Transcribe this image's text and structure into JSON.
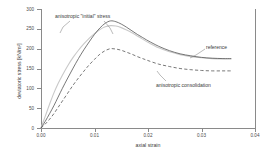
{
  "chart_data": {
    "type": "line",
    "title": "",
    "xlabel": "axial strain",
    "ylabel": "deviatoric stress [kN/m²]",
    "xlim": [
      0.0,
      0.04
    ],
    "ylim": [
      0,
      300
    ],
    "xticks": [
      "0.00",
      "0.01",
      "0.02",
      "0.03",
      "0.04"
    ],
    "xtick_values": [
      0.0,
      0.01,
      0.02,
      0.03,
      0.04
    ],
    "yticks": [
      "0",
      "50",
      "100",
      "150",
      "200",
      "250",
      "300"
    ],
    "ytick_values": [
      0,
      50,
      100,
      150,
      200,
      250,
      300
    ],
    "grid": false,
    "legend_position": "inline-annotations",
    "series": [
      {
        "name": "anisotropic \"initial\" stress",
        "style": "solid",
        "color": "#c9c9c9",
        "x": [
          0.0,
          0.0008,
          0.0016,
          0.0024,
          0.0032,
          0.004,
          0.005,
          0.006,
          0.007,
          0.008,
          0.009,
          0.01,
          0.011,
          0.012,
          0.013,
          0.014,
          0.015,
          0.016,
          0.017,
          0.018,
          0.019,
          0.02,
          0.022,
          0.024,
          0.026,
          0.028,
          0.03,
          0.032,
          0.034,
          0.0355
        ],
        "y": [
          0,
          30,
          60,
          88,
          112,
          133,
          157,
          178,
          196,
          212,
          226,
          238,
          248,
          255,
          258,
          257,
          253,
          247,
          240,
          232,
          224,
          216,
          202,
          192,
          185,
          180,
          177,
          175,
          174,
          174
        ]
      },
      {
        "name": "reference",
        "style": "solid",
        "color": "#555555",
        "x": [
          0.0,
          0.0008,
          0.0016,
          0.0024,
          0.0032,
          0.004,
          0.005,
          0.006,
          0.007,
          0.008,
          0.009,
          0.01,
          0.011,
          0.012,
          0.013,
          0.014,
          0.015,
          0.016,
          0.017,
          0.018,
          0.019,
          0.02,
          0.022,
          0.024,
          0.026,
          0.028,
          0.03,
          0.032,
          0.034,
          0.0355
        ],
        "y": [
          0,
          17,
          36,
          56,
          78,
          100,
          126,
          151,
          175,
          197,
          217,
          236,
          252,
          264,
          270,
          268,
          262,
          254,
          245,
          236,
          228,
          220,
          206,
          195,
          187,
          182,
          178,
          176,
          175,
          175
        ]
      },
      {
        "name": "anisotropic consolidation",
        "style": "dashed",
        "color": "#555555",
        "x": [
          0.0,
          0.0008,
          0.0016,
          0.0024,
          0.0032,
          0.004,
          0.005,
          0.006,
          0.007,
          0.008,
          0.009,
          0.01,
          0.011,
          0.012,
          0.013,
          0.014,
          0.015,
          0.016,
          0.017,
          0.018,
          0.019,
          0.02,
          0.022,
          0.024,
          0.026,
          0.028,
          0.03,
          0.032,
          0.034,
          0.0355
        ],
        "y": [
          0,
          10,
          22,
          36,
          52,
          68,
          88,
          108,
          126,
          143,
          159,
          173,
          186,
          195,
          200,
          199,
          196,
          191,
          186,
          180,
          175,
          170,
          161,
          155,
          150,
          147,
          145,
          144,
          144,
          144
        ]
      }
    ],
    "annotations": [
      {
        "id": "anisotropic-initial-stress",
        "text": "anisotropic \"initial\" stress",
        "leader": "two-branch-pointer"
      },
      {
        "id": "reference",
        "text": "reference",
        "leader": "diagonal-pointer"
      },
      {
        "id": "anisotropic-consolidation",
        "text": "anisotropic consolidation",
        "leader": "diagonal-pointer"
      }
    ]
  },
  "colors": {
    "axis": "#8a8a8a",
    "text": "#3a3a3a",
    "reference_curve": "#555555",
    "initial_stress_curve": "#c9c9c9",
    "consolidation_curve": "#555555",
    "background": "#ffffff"
  }
}
